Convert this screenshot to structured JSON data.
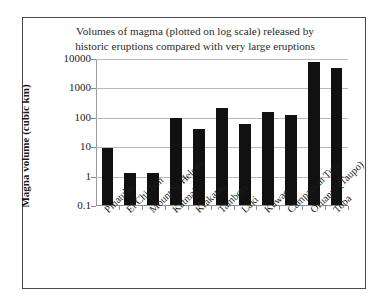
{
  "chart_data": {
    "type": "bar",
    "title": "Volumes of magma (plotted on log scale) released by historic eruptions compared with very large eruptions",
    "title_line1": "Volumes of magma (plotted on log scale) released by",
    "title_line2": "historic eruptions compared with very large eruptions",
    "xlabel": "",
    "ylabel": "Magna volume (cubic km)",
    "yscale": "log",
    "ylim": [
      0.1,
      10000
    ],
    "ytick_labels": [
      "10000",
      "1000",
      "100",
      "10",
      "1",
      "0.1"
    ],
    "ytick_values": [
      10000,
      1000,
      100,
      10,
      1,
      0.1
    ],
    "grid": true,
    "legend": "none",
    "bar_color": "#111111",
    "categories": [
      "Pinatubo",
      "El Chichon",
      "Mount St Helens",
      "Katmai",
      "Krakatau",
      "Tambora",
      "Laki",
      "Kuwae",
      "Campanian Tuff",
      "Oruanui (Taupo)",
      "Toba"
    ],
    "values": [
      8.5,
      1.2,
      1.2,
      90,
      38,
      200,
      55,
      150,
      120,
      7500,
      4700
    ]
  }
}
